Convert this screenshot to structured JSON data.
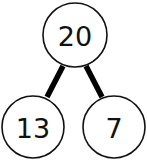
{
  "diagram": {
    "type": "number-bond",
    "whole": {
      "label": "20"
    },
    "parts": [
      {
        "label": "13"
      },
      {
        "label": "7"
      }
    ],
    "colors": {
      "stroke": "#111111",
      "fill": "#ffffff",
      "text": "#111111"
    }
  }
}
